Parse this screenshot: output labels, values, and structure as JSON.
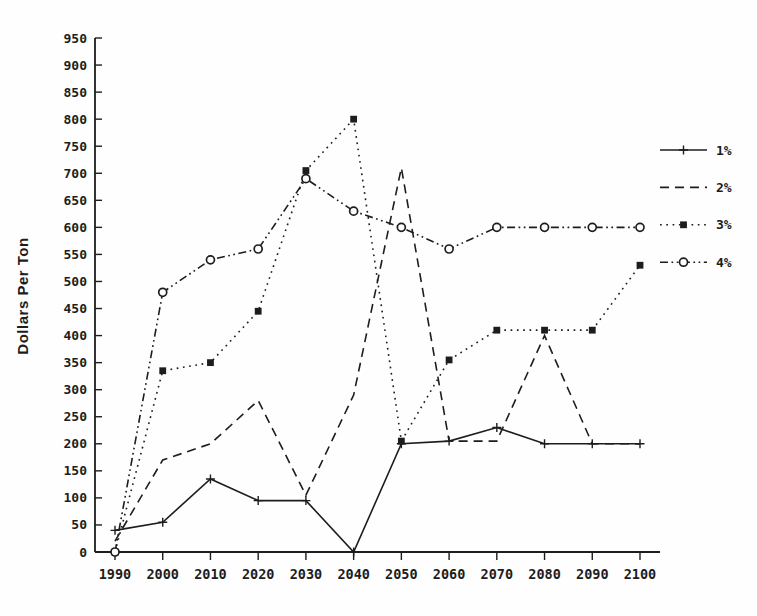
{
  "figure": {
    "background": "#fefefe",
    "ink_color": "#1d1d1d"
  },
  "chart_data": {
    "type": "line",
    "title": "",
    "xlabel": "",
    "ylabel": "Dollars Per Ton",
    "x": [
      1990,
      2000,
      2010,
      2020,
      2030,
      2040,
      2050,
      2060,
      2070,
      2080,
      2090,
      2100
    ],
    "x_tick_labels": [
      "1990",
      "2000",
      "2010",
      "2020",
      "2030",
      "2040",
      "2050",
      "2060",
      "2070",
      "2080",
      "2090",
      "2100"
    ],
    "y_ticks": [
      0,
      50,
      100,
      150,
      200,
      250,
      300,
      350,
      400,
      450,
      500,
      550,
      600,
      650,
      700,
      750,
      800,
      850,
      900,
      950
    ],
    "ylim": [
      0,
      950
    ],
    "grid": false,
    "legend_position": "right",
    "series": [
      {
        "name": "1%",
        "line_style": "solid",
        "marker": "plus",
        "values": [
          40,
          55,
          135,
          95,
          95,
          0,
          200,
          205,
          230,
          200,
          200,
          200
        ]
      },
      {
        "name": "2%",
        "line_style": "dashed",
        "marker": "none",
        "values": [
          20,
          170,
          200,
          280,
          105,
          290,
          710,
          205,
          205,
          400,
          200,
          200
        ]
      },
      {
        "name": "3%",
        "line_style": "dotted",
        "marker": "filled-square",
        "values": [
          0,
          335,
          350,
          445,
          705,
          800,
          205,
          355,
          410,
          410,
          410,
          530
        ]
      },
      {
        "name": "4%",
        "line_style": "dash-dot",
        "marker": "open-circle",
        "values": [
          0,
          480,
          540,
          560,
          690,
          630,
          600,
          560,
          600,
          600,
          600,
          600
        ]
      }
    ]
  }
}
